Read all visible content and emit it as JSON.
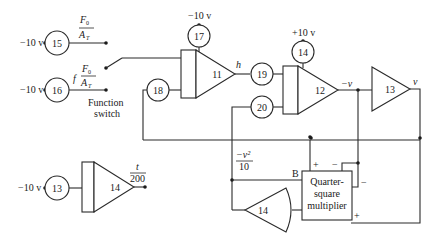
{
  "diagram": {
    "type": "analog-computer-circuit",
    "inputs": {
      "v15": "−10 v",
      "v16": "−10 v",
      "v13": "−10 v",
      "v17": "−10 v",
      "v14top": "+10 v"
    },
    "potentiometers": {
      "p15": "15",
      "p16": "16",
      "p17": "17",
      "p18": "18",
      "p19": "19",
      "p20": "20",
      "p14": "14",
      "p13": "13"
    },
    "amplifiers": {
      "a11": "11",
      "a12": "12",
      "a13": "13",
      "a14_timer": "14",
      "a14_mult": "14"
    },
    "labels": {
      "f0_num": "F",
      "f0_sub": "0",
      "at_den": "A",
      "at_sub": "T",
      "f_prefix": "f",
      "switch_line1": "Function",
      "switch_line2": "switch",
      "h": "h",
      "neg_v": "−v",
      "v": "v",
      "t_num": "t",
      "t_den": "200",
      "v2_num": "−v²",
      "v2_den": "10",
      "B": "B",
      "mult_line1": "Quarter-",
      "mult_line2": "square",
      "mult_line3": "multiplier",
      "plus_top": "+",
      "minus_top": "−",
      "minus_right": "−",
      "plus_right": "+"
    }
  }
}
